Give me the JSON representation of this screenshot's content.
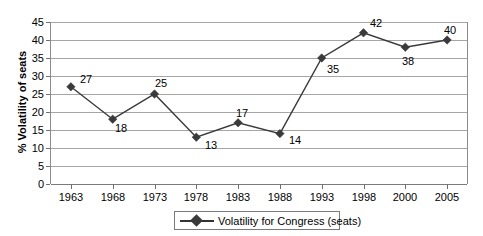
{
  "chart_data": {
    "type": "line",
    "title": "",
    "xlabel": "",
    "ylabel": "% Volatility of seats",
    "ylim": [
      0,
      45
    ],
    "ytick_step": 5,
    "yticks": [
      0,
      5,
      10,
      15,
      20,
      25,
      30,
      35,
      40,
      45
    ],
    "categories": [
      "1963",
      "1968",
      "1973",
      "1978",
      "1983",
      "1988",
      "1993",
      "1998",
      "2000",
      "2005"
    ],
    "values": [
      27,
      18,
      25,
      13,
      17,
      14,
      35,
      42,
      38,
      40
    ],
    "series": [
      {
        "name": "Volatility for Congress (seats)",
        "values": [
          27,
          18,
          25,
          13,
          17,
          14,
          35,
          42,
          38,
          40
        ]
      }
    ],
    "data_labels": [
      "27",
      "18",
      "25",
      "13",
      "17",
      "14",
      "35",
      "42",
      "38",
      "40"
    ],
    "label_offsets": [
      {
        "dx": 9,
        "dy": -13
      },
      {
        "dx": 2,
        "dy": 4
      },
      {
        "dx": 0,
        "dy": -16
      },
      {
        "dx": 9,
        "dy": 3
      },
      {
        "dx": -2,
        "dy": -15
      },
      {
        "dx": 9,
        "dy": 1
      },
      {
        "dx": 5,
        "dy": 6
      },
      {
        "dx": 6,
        "dy": -15
      },
      {
        "dx": -3,
        "dy": 9
      },
      {
        "dx": -3,
        "dy": -15
      }
    ],
    "grid": true,
    "legend_position": "bottom",
    "marker": "diamond",
    "line_color": "#3a3a3a",
    "marker_color": "#3a3a3a",
    "grid_color": "#a6a6a6"
  },
  "legend": {
    "label": "Volatility for Congress (seats)",
    "marker_name": "diamond-marker"
  }
}
